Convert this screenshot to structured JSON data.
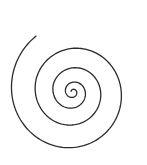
{
  "figure": {
    "type": "spiral",
    "background": "#ffffff",
    "stroke_color": "#2a2a2a",
    "stroke_width": 1.3,
    "center": [
      73,
      92
    ],
    "start_angle_deg": 200,
    "turns": 4.1,
    "inner_radius": 2,
    "radii_by_turn": [
      2,
      8,
      21,
      39,
      63
    ],
    "end_point": [
      144,
      50
    ]
  }
}
